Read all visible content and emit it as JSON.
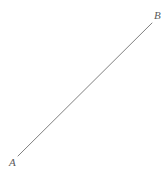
{
  "figure": {
    "width": 167,
    "height": 176,
    "background_color": "#ffffff"
  },
  "labels": {
    "point_a": "A",
    "point_b": "B"
  },
  "chart_data": {
    "type": "diagram",
    "subtype": "line-segment",
    "title": "",
    "xlabel": "",
    "ylabel": "",
    "grid": false,
    "legend": null,
    "axes": false,
    "background_color": "#ffffff",
    "stroke_color": "#808080",
    "stroke_width": 1,
    "label_color": "#5a5a5a",
    "points": [
      {
        "name": "A",
        "x": 18,
        "y": 156,
        "label": "A",
        "label_position": "below-left"
      },
      {
        "name": "B",
        "x": 152,
        "y": 23,
        "label": "B",
        "label_position": "above-right"
      }
    ],
    "segments": [
      {
        "from": "A",
        "to": "B",
        "x1": 18,
        "y1": 156,
        "x2": 152,
        "y2": 23
      }
    ]
  }
}
